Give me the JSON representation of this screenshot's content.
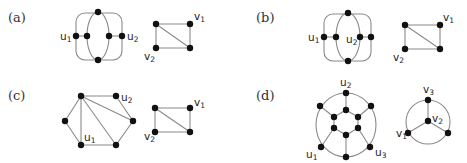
{
  "figure": {
    "panels": [
      {
        "id": "a",
        "label": "(a)",
        "left_graph": {
          "labels": [
            {
              "name": "u",
              "sub": "1"
            },
            {
              "name": "u",
              "sub": "2"
            }
          ]
        },
        "right_graph": {
          "labels": [
            {
              "name": "v",
              "sub": "1"
            },
            {
              "name": "v",
              "sub": "2"
            }
          ]
        }
      },
      {
        "id": "b",
        "label": "(b)",
        "left_graph": {
          "labels": [
            {
              "name": "u",
              "sub": "1"
            },
            {
              "name": "u",
              "sub": "2"
            }
          ]
        },
        "right_graph": {
          "labels": [
            {
              "name": "v",
              "sub": "1"
            },
            {
              "name": "v",
              "sub": "2"
            }
          ]
        }
      },
      {
        "id": "c",
        "label": "(c)",
        "left_graph": {
          "labels": [
            {
              "name": "u",
              "sub": "1"
            },
            {
              "name": "u",
              "sub": "2"
            }
          ]
        },
        "right_graph": {
          "labels": [
            {
              "name": "v",
              "sub": "1"
            },
            {
              "name": "v",
              "sub": "2"
            }
          ]
        }
      },
      {
        "id": "d",
        "label": "(d)",
        "left_graph": {
          "labels": [
            {
              "name": "u",
              "sub": "1"
            },
            {
              "name": "u",
              "sub": "2"
            },
            {
              "name": "u",
              "sub": "3"
            }
          ]
        },
        "right_graph": {
          "labels": [
            {
              "name": "v",
              "sub": "1"
            },
            {
              "name": "v",
              "sub": "2"
            },
            {
              "name": "v",
              "sub": "3"
            }
          ]
        }
      }
    ],
    "colors": {
      "edge": "#8a8a8a",
      "node": "#111111",
      "text": "#222222"
    }
  }
}
